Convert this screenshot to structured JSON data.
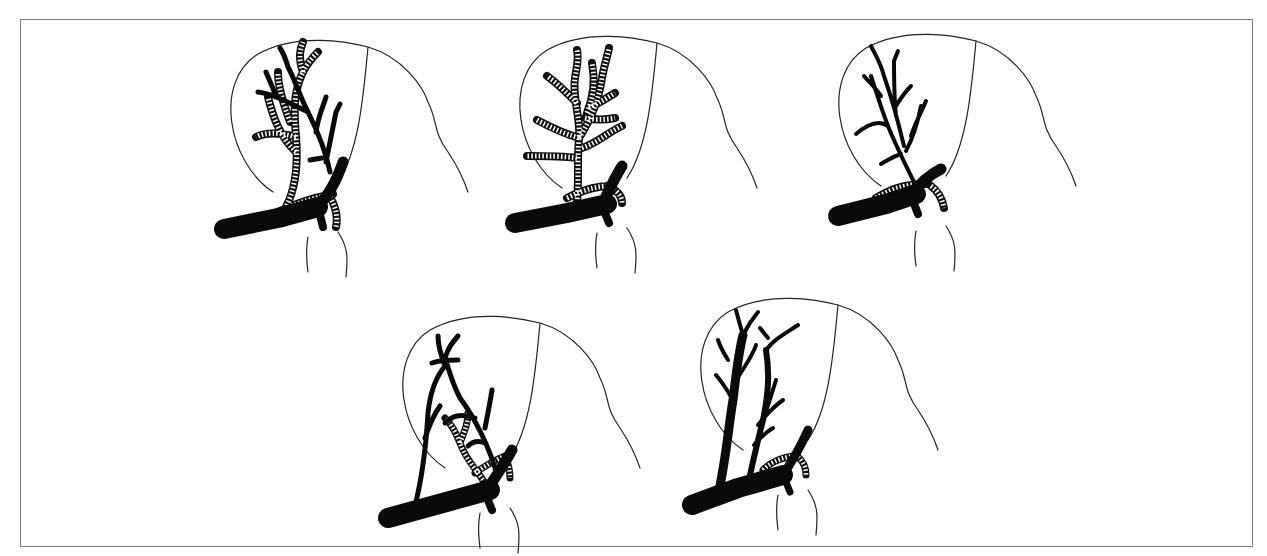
{
  "figure": {
    "frame": {
      "border_color": "#7a7a7a",
      "background": "#ffffff"
    },
    "colors": {
      "ink": "#0a0a0a",
      "paper": "#ffffff",
      "outline": "#222222"
    },
    "legend": {
      "solid": "solid black branching vessel",
      "hatched": "hatched (striped) branching vessel"
    },
    "panels": [
      {
        "id": "panel-1",
        "row": 1,
        "col": 1,
        "solid_tree": "partial",
        "hatched_tree": "dominant"
      },
      {
        "id": "panel-2",
        "row": 1,
        "col": 2,
        "solid_tree": "trunk-only",
        "hatched_tree": "full"
      },
      {
        "id": "panel-3",
        "row": 1,
        "col": 3,
        "solid_tree": "full",
        "hatched_tree": "stub"
      },
      {
        "id": "panel-4",
        "row": 2,
        "col": 1,
        "solid_tree": "full",
        "hatched_tree": "small"
      },
      {
        "id": "panel-5",
        "row": 2,
        "col": 2,
        "solid_tree": "full",
        "hatched_tree": "stub"
      }
    ]
  }
}
